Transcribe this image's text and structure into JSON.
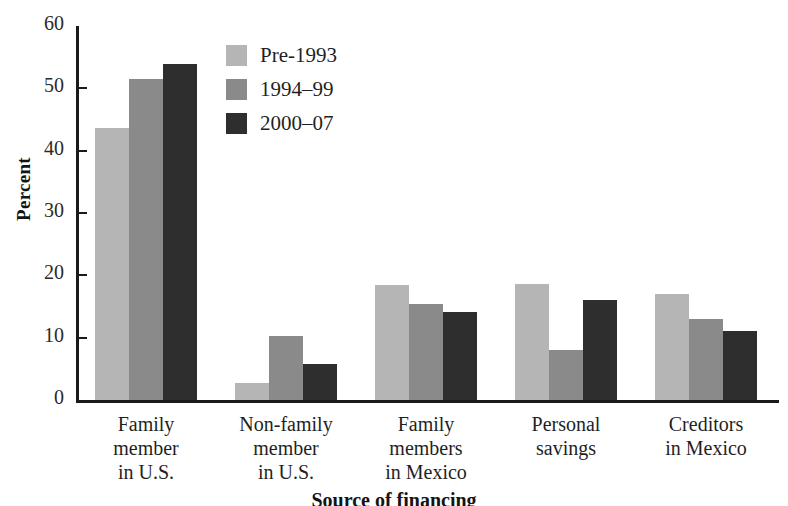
{
  "chart_data": {
    "type": "bar",
    "title": "",
    "xlabel": "Source of financing",
    "ylabel": "Percent",
    "ylim": [
      0,
      60
    ],
    "yticks": [
      "0",
      "10",
      "20",
      "30",
      "40",
      "50",
      "60"
    ],
    "grid": false,
    "legend_position": "top-center-left",
    "categories": [
      "Family member in U.S.",
      "Non-family member in U.S.",
      "Family members in Mexico",
      "Personal savings",
      "Creditors in Mexico"
    ],
    "category_lines": [
      [
        "Family",
        "member",
        "in U.S."
      ],
      [
        "Non-family",
        "member",
        "in U.S."
      ],
      [
        "Family",
        "members",
        "in Mexico"
      ],
      [
        "Personal",
        "savings"
      ],
      [
        "Creditors",
        "in Mexico"
      ]
    ],
    "series": [
      {
        "name": "Pre-1993",
        "color": "#b5b5b5",
        "values": [
          43.7,
          2.7,
          18.4,
          18.6,
          17.0
        ]
      },
      {
        "name": "1994–99",
        "color": "#8a8a8a",
        "values": [
          51.5,
          10.3,
          15.4,
          8.0,
          13.0
        ]
      },
      {
        "name": "2000–07",
        "color": "#2e2e2e",
        "values": [
          53.9,
          5.7,
          14.1,
          16.0,
          11.0
        ]
      }
    ]
  },
  "axis": {
    "y_title": "Percent",
    "x_title": "Source of financing"
  },
  "colors": {
    "series_1": "#b5b5b5",
    "series_2": "#8a8a8a",
    "series_3": "#2e2e2e",
    "axis": "#1a1a1a",
    "text": "#1f1f1f",
    "background": "#ffffff"
  }
}
